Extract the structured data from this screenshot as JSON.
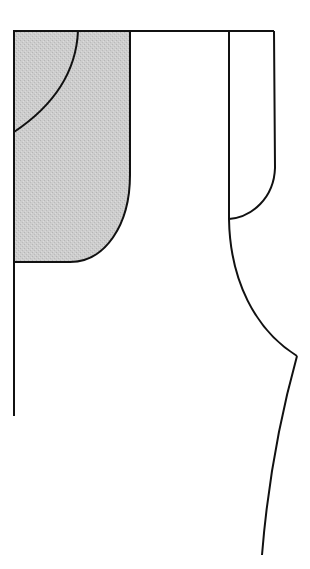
{
  "diagram": {
    "type": "pattern-drafting-line-drawing",
    "width": 310,
    "height": 569,
    "colors": {
      "background": "#ffffff",
      "line": "#111111",
      "shaded_fill": "#c9c9c9"
    },
    "elements": [
      {
        "name": "top-edge-line",
        "kind": "line",
        "points": [
          [
            14,
            31
          ],
          [
            274,
            31
          ]
        ]
      },
      {
        "name": "left-edge-line",
        "kind": "line",
        "points": [
          [
            14,
            31
          ],
          [
            14,
            416
          ]
        ]
      },
      {
        "name": "shaded-facing-panel",
        "kind": "shaded-region",
        "bounds": {
          "x": 14,
          "y": 31,
          "right": 130,
          "bottom": 262
        }
      },
      {
        "name": "neckline-arc",
        "kind": "curve",
        "from": [
          78,
          31
        ],
        "to": [
          14,
          132
        ]
      },
      {
        "name": "center-vertical-line",
        "kind": "line",
        "points": [
          [
            229,
            31
          ],
          [
            229,
            219
          ]
        ]
      },
      {
        "name": "right-facing-outline",
        "kind": "curve",
        "from": [
          274,
          31
        ],
        "to": [
          229,
          219
        ]
      },
      {
        "name": "armhole-curve",
        "kind": "curve",
        "from": [
          229,
          219
        ],
        "to": [
          297,
          356
        ]
      },
      {
        "name": "side-seam-line",
        "kind": "curve",
        "from": [
          297,
          356
        ],
        "to": [
          262,
          555
        ]
      }
    ]
  }
}
